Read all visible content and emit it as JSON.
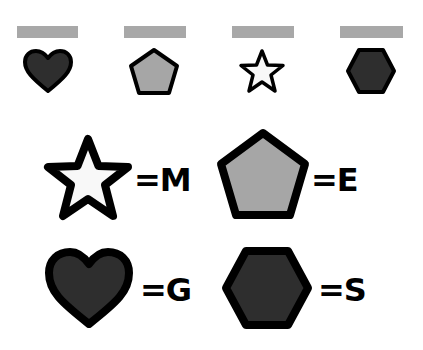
{
  "puzzle": {
    "blanks": [
      {
        "shape": "heart",
        "fill": "#2e2e2e",
        "answer": ""
      },
      {
        "shape": "pentagon",
        "fill": "#a6a6a6",
        "answer": ""
      },
      {
        "shape": "star",
        "fill": "#f8f8f8",
        "answer": ""
      },
      {
        "shape": "hexagon",
        "fill": "#2e2e2e",
        "answer": ""
      }
    ],
    "blank_color": "#a8a8a8",
    "key": [
      {
        "shape": "star",
        "label": "=M"
      },
      {
        "shape": "pentagon",
        "label": "=E"
      },
      {
        "shape": "heart",
        "label": "=G"
      },
      {
        "shape": "hexagon",
        "label": "=S"
      }
    ]
  }
}
